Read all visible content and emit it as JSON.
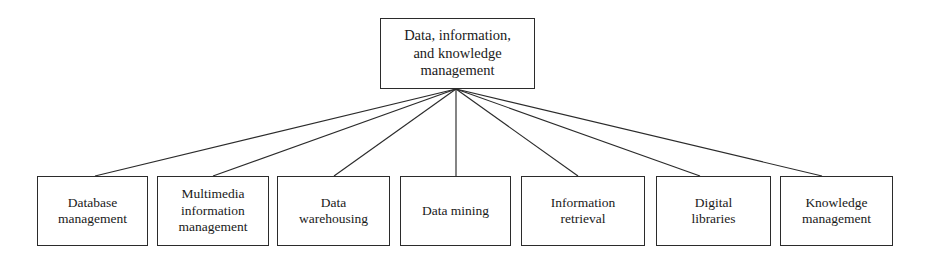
{
  "diagram": {
    "type": "hierarchy-tree",
    "orientation": "top-down",
    "background_color": "#ffffff",
    "line_color": "#2b2b2b",
    "text_color": "#1a1a1a",
    "root": {
      "id": "root",
      "label": "Data, information,\nand knowledge\nmanagement"
    },
    "children": [
      {
        "id": "database-management",
        "label": "Database\nmanagement"
      },
      {
        "id": "multimedia-information-management",
        "label": "Multimedia\ninformation\nmanagement"
      },
      {
        "id": "data-warehousing",
        "label": "Data\nwarehousing"
      },
      {
        "id": "data-mining",
        "label": "Data mining"
      },
      {
        "id": "information-retrieval",
        "label": "Information\nretrieval"
      },
      {
        "id": "digital-libraries",
        "label": "Digital\nlibraries"
      },
      {
        "id": "knowledge-management",
        "label": "Knowledge\nmanagement"
      }
    ],
    "edges": [
      {
        "from": "root",
        "to": "database-management"
      },
      {
        "from": "root",
        "to": "multimedia-information-management"
      },
      {
        "from": "root",
        "to": "data-warehousing"
      },
      {
        "from": "root",
        "to": "data-mining"
      },
      {
        "from": "root",
        "to": "information-retrieval"
      },
      {
        "from": "root",
        "to": "digital-libraries"
      },
      {
        "from": "root",
        "to": "knowledge-management"
      }
    ]
  }
}
